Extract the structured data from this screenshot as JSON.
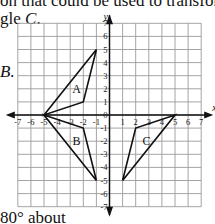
{
  "text": {
    "line1": "on that could be used to transform",
    "line2": "gle C.",
    "label_b_option": "B.",
    "line_bottom": "80° about"
  },
  "graph": {
    "x_axis_label": "x",
    "y_axis_label": "y",
    "x_ticks": [
      "-7",
      "-6",
      "-5",
      "-4",
      "-3",
      "-2",
      "-1",
      "1",
      "2",
      "3",
      "4",
      "5",
      "6",
      "7"
    ],
    "y_ticks": [
      "7",
      "6",
      "5",
      "4",
      "3",
      "2",
      "1",
      "0",
      "-1",
      "-2",
      "-3",
      "-4",
      "-5",
      "-6",
      "-7"
    ],
    "range": {
      "xmin": -7,
      "xmax": 7,
      "ymin": -7,
      "ymax": 7
    },
    "triangles": [
      {
        "label": "A",
        "vertices": [
          [
            -5,
            0
          ],
          [
            -1,
            5
          ],
          [
            -2,
            1
          ]
        ]
      },
      {
        "label": "B",
        "vertices": [
          [
            -5,
            0
          ],
          [
            -2,
            -1
          ],
          [
            -1,
            -5
          ]
        ]
      },
      {
        "label": "C",
        "vertices": [
          [
            5,
            0
          ],
          [
            2,
            -1
          ],
          [
            1,
            -5
          ]
        ]
      }
    ]
  }
}
